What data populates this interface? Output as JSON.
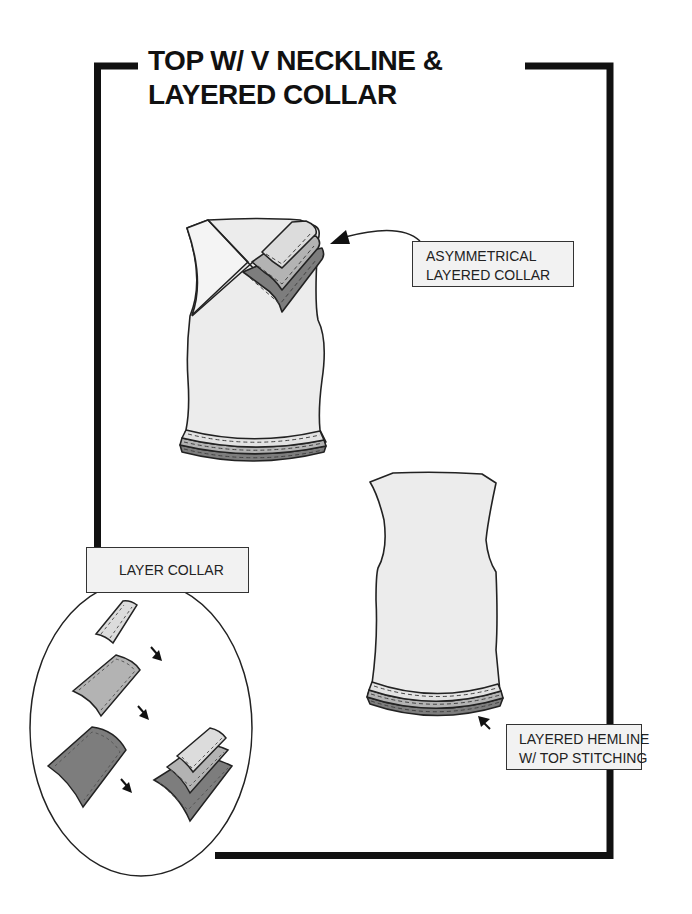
{
  "title": {
    "line1": "TOP W/ V NECKLINE &",
    "line2": "LAYERED COLLAR"
  },
  "callouts": {
    "asymmetrical_collar": {
      "line1": "ASYMMETRICAL",
      "line2": "LAYERED COLLAR"
    },
    "layered_hemline": {
      "line1": "LAYERED HEMLINE",
      "line2": "W/ TOP STITCHING"
    },
    "layer_collar": {
      "label": "LAYER COLLAR"
    }
  },
  "colors": {
    "frame": "#111111",
    "garment_fill": "#ececec",
    "layer_light": "#dcdcdc",
    "layer_mid": "#b3b3b3",
    "layer_dark": "#7d7d7d",
    "outline": "#222222",
    "label_bg": "#f2f2f2"
  },
  "illustrations": {
    "front_view": "front-top-with-v-neckline-and-asymmetrical-layered-collar",
    "back_view": "back-top-with-layered-hemline",
    "detail_oval": "layer-collar-assembly-steps",
    "steps": [
      "light-collar-piece",
      "medium-collar-piece",
      "dark-collar-piece",
      "assembled-layered-collar"
    ]
  }
}
